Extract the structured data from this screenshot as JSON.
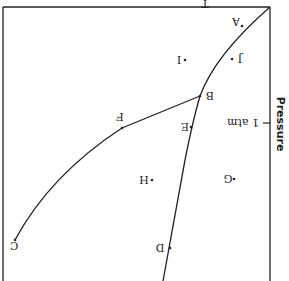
{
  "diagram": {
    "type": "phase-diagram",
    "orientation": "rotated-180",
    "axis": {
      "y_label": "Pressure",
      "x_label_partial": "T",
      "tick_label": "1 atm"
    },
    "points": {
      "A": "A",
      "B": "B",
      "C": "C",
      "D": "D",
      "E": "E",
      "F": "F",
      "G": "G",
      "H": "H",
      "I": "I",
      "J": "J"
    },
    "colors": {
      "line": "#222222",
      "background": "#ffffff"
    }
  }
}
